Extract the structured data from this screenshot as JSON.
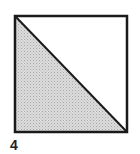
{
  "figure": {
    "label": "4",
    "shape": "square",
    "division": "diagonal from top-left to bottom-right",
    "shaded_region": "lower-left triangle",
    "shaded_fraction": 0.5,
    "colors": {
      "stroke": "#1a1a1a",
      "shade": "#cfcfcf",
      "background": "#ffffff"
    }
  }
}
